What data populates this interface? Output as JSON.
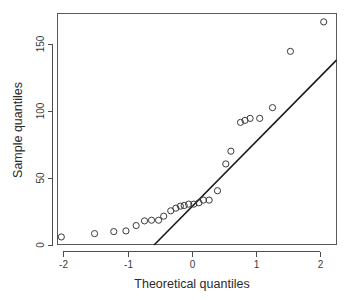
{
  "chart_data": {
    "type": "scatter",
    "title": "",
    "xlabel": "Theoretical quantiles",
    "ylabel": "Sample quantiles",
    "xlim": [
      -2.35,
      2.27
    ],
    "ylim": [
      -3,
      172
    ],
    "grid": false,
    "legend": "none",
    "x_ticks": [
      -2,
      -1,
      0,
      1,
      2
    ],
    "x_tick_labels": [
      "-2",
      "-1",
      "0",
      "1",
      "2"
    ],
    "y_ticks": [
      0,
      50,
      100,
      150
    ],
    "y_tick_labels": [
      "0",
      "50",
      "100",
      "150"
    ],
    "marker": "open-circle",
    "point_color": "#3a3a3a",
    "line_color": "#1a1a1a",
    "x": [
      -2.05,
      -1.53,
      -1.23,
      -1.04,
      -0.88,
      -0.75,
      -0.64,
      -0.55,
      -0.45,
      -0.36,
      -0.28,
      -0.2,
      -0.13,
      -0.06,
      0.0,
      0.06,
      0.13,
      0.2,
      0.28,
      0.36,
      0.45,
      0.55,
      0.64,
      0.75,
      0.88,
      1.04,
      1.23,
      1.53,
      2.05
    ],
    "y": [
      6.0,
      8.5,
      10.0,
      10.5,
      14.5,
      18.0,
      18.5,
      21.5,
      25.5,
      27.5,
      29.0,
      29.5,
      30.5,
      30.5,
      31.5,
      33.5,
      33.5,
      40.5,
      60.5,
      70.0,
      91.5,
      93.0,
      94.5,
      102.5,
      144.5,
      166.5
    ],
    "points": [
      {
        "x": -2.05,
        "y": 6.0
      },
      {
        "x": -1.53,
        "y": 8.5
      },
      {
        "x": -1.23,
        "y": 10.0
      },
      {
        "x": -1.04,
        "y": 10.5
      },
      {
        "x": -0.88,
        "y": 14.5
      },
      {
        "x": -0.75,
        "y": 18.0
      },
      {
        "x": -0.64,
        "y": 18.5
      },
      {
        "x": -0.53,
        "y": 18.5
      },
      {
        "x": -0.45,
        "y": 21.5
      },
      {
        "x": -0.34,
        "y": 25.5
      },
      {
        "x": -0.26,
        "y": 27.5
      },
      {
        "x": -0.19,
        "y": 29.0
      },
      {
        "x": -0.13,
        "y": 29.5
      },
      {
        "x": -0.06,
        "y": 30.5
      },
      {
        "x": 0.02,
        "y": 30.5
      },
      {
        "x": 0.1,
        "y": 31.5
      },
      {
        "x": 0.17,
        "y": 33.5
      },
      {
        "x": 0.26,
        "y": 33.5
      },
      {
        "x": 0.39,
        "y": 40.5
      },
      {
        "x": 0.52,
        "y": 60.5
      },
      {
        "x": 0.6,
        "y": 70.0
      },
      {
        "x": 0.75,
        "y": 91.5
      },
      {
        "x": 0.82,
        "y": 93.0
      },
      {
        "x": 0.9,
        "y": 94.5
      },
      {
        "x": 1.05,
        "y": 94.5
      },
      {
        "x": 1.25,
        "y": 102.5
      },
      {
        "x": 1.53,
        "y": 144.5
      },
      {
        "x": 2.05,
        "y": 166.5
      }
    ],
    "reference_line": {
      "x1": -0.6,
      "y1": 0.0,
      "x2": 2.25,
      "y2": 138.0
    }
  }
}
